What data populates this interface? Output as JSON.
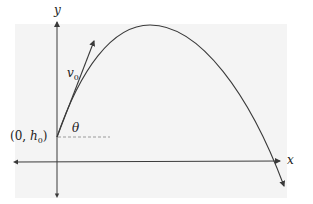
{
  "diagram": {
    "axes": {
      "x_label": "x",
      "y_label": "y"
    },
    "labels": {
      "velocity": {
        "symbol": "v",
        "subscript": "0"
      },
      "angle": "θ",
      "origin_point": {
        "open": "(0, ",
        "symbol": "h",
        "subscript": "0",
        "close": ")"
      }
    },
    "colors": {
      "stroke": "#3a3a3a",
      "dashed": "#9a9a9a",
      "background_shade": "#f4f4f4"
    }
  }
}
